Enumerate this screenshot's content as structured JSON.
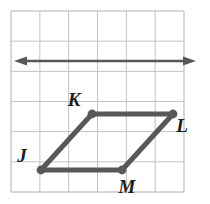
{
  "figure": {
    "background_color": "#ffffff",
    "grid": {
      "line_color": "#c2c2c2",
      "border_color": "#b0b0b0",
      "columns": 6,
      "rows": 6,
      "cell_size": 28.8,
      "left": 11,
      "top": 11,
      "right": 184,
      "bottom": 192
    },
    "stroke_color": "#585858",
    "arrow": {
      "name": "horizontal-double-arrow",
      "y": 61,
      "x_start": 14,
      "x_end": 196,
      "stroke_width": 2.6,
      "heads": "both"
    },
    "shape": {
      "name": "parallelogram-JKLM",
      "stroke_width": 5,
      "vertex_radius": 4.4,
      "vertices": [
        {
          "id": "J",
          "label": "J",
          "x": 41,
          "y": 170,
          "label_x": 22,
          "label_y": 162
        },
        {
          "id": "K",
          "label": "K",
          "x": 92,
          "y": 114,
          "label_x": 74,
          "label_y": 106
        },
        {
          "id": "L",
          "label": "L",
          "x": 173,
          "y": 114,
          "label_x": 182,
          "label_y": 132
        },
        {
          "id": "M",
          "label": "M",
          "x": 122,
          "y": 170,
          "label_x": 127,
          "label_y": 193
        }
      ],
      "edges": [
        {
          "from": "J",
          "to": "K"
        },
        {
          "from": "K",
          "to": "L"
        },
        {
          "from": "L",
          "to": "M"
        },
        {
          "from": "M",
          "to": "J"
        }
      ]
    }
  }
}
